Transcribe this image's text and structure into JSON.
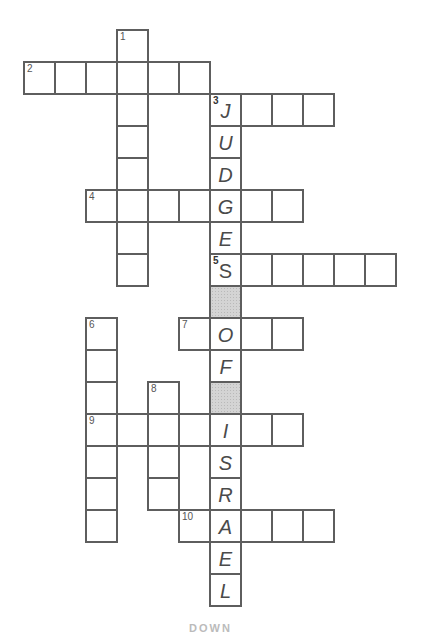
{
  "puzzle": {
    "cell_pitch_x": 31,
    "cell_pitch_y": 32,
    "origin_x": 23,
    "origin_y": 29,
    "colors": {
      "border": "#5e5e5e",
      "shaded": "#d4d4d4",
      "letter": "#4a4a4a"
    },
    "words": [
      {
        "number": 1,
        "direction": "down",
        "col": 3,
        "row": 0,
        "length": 8
      },
      {
        "number": 2,
        "direction": "across",
        "col": 0,
        "row": 1,
        "length": 6
      },
      {
        "number": 3,
        "direction": "across",
        "col": 6,
        "row": 2,
        "length": 4
      },
      {
        "number": 4,
        "direction": "across",
        "col": 2,
        "row": 5,
        "length": 7
      },
      {
        "number": 5,
        "direction": "across",
        "col": 6,
        "row": 7,
        "length": 6
      },
      {
        "number": 6,
        "direction": "down",
        "col": 2,
        "row": 9,
        "length": 7
      },
      {
        "number": 7,
        "direction": "across",
        "col": 5,
        "row": 9,
        "length": 4
      },
      {
        "number": 8,
        "direction": "down",
        "col": 4,
        "row": 11,
        "length": 4
      },
      {
        "number": 9,
        "direction": "across",
        "col": 2,
        "row": 12,
        "length": 7
      },
      {
        "number": 10,
        "direction": "across",
        "col": 5,
        "row": 15,
        "length": 5
      }
    ],
    "theme_column": {
      "col": 6,
      "row": 2,
      "text": "JUDGES_OF_ISRAEL",
      "letters": [
        "J",
        "U",
        "D",
        "G",
        "E",
        "S",
        "",
        "O",
        "F",
        "",
        "I",
        "S",
        "R",
        "A",
        "E",
        "L"
      ],
      "shaded_rows": [
        8,
        11
      ]
    }
  },
  "footer": {
    "label": "DOWN"
  }
}
